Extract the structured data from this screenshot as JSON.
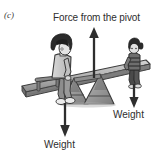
{
  "figure": {
    "panel_label": "(c)",
    "width": 161,
    "height": 162,
    "background": "#ffffff",
    "ink_color": "#2e2e2e",
    "scene": "seesaw with two children and force arrows"
  },
  "labels": {
    "pivot_force": "Force from the pivot",
    "weight_right": "Weight",
    "weight_left": "Weight"
  },
  "arrows": [
    {
      "name": "force-from-pivot-arrow",
      "direction": "up",
      "label": "Force from the pivot",
      "x": 94,
      "from_y": 78,
      "to_y": 28,
      "color": "#2e2e2e"
    },
    {
      "name": "weight-right-arrow",
      "direction": "down",
      "label": "Weight",
      "x": 134,
      "from_y": 84,
      "to_y": 107,
      "color": "#2e2e2e"
    },
    {
      "name": "weight-left-arrow",
      "direction": "down",
      "label": "Weight",
      "x": 65,
      "from_y": 103,
      "to_y": 136,
      "color": "#2e2e2e"
    }
  ],
  "figures": {
    "left_child": {
      "name": "large-child",
      "position": "left end of plank",
      "hair_color": "#2b2b2b",
      "shirt_color": "#c9c9c9",
      "trousers_color": "#8d8d8d",
      "shoe_color": "#e6e6e6"
    },
    "right_child": {
      "name": "small-child",
      "position": "right end of plank",
      "hair_color": "#2b2b2b",
      "shirt_color": "#6e6e6e",
      "trousers_color": "#4a4a4a",
      "shoe_color": "#d8d8d8"
    }
  },
  "equipment": {
    "plank": {
      "name": "seesaw-plank",
      "color": "#b5b5b5",
      "edge_color": "#4a4a4a",
      "left_end_low": true
    },
    "pivot": {
      "name": "pivot-trestle",
      "color": "#9a9a9a",
      "shape": "triangular frame"
    },
    "handle": {
      "name": "seesaw-handle",
      "color": "#6b6b6b"
    }
  }
}
